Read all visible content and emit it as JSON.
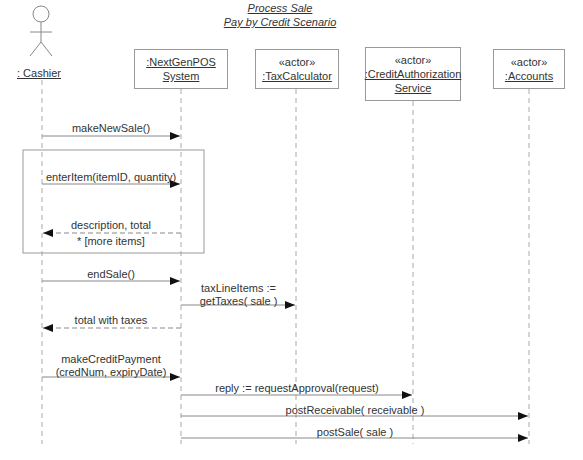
{
  "title": {
    "line1": "Process Sale",
    "line2": "Pay by Credit Scenario"
  },
  "participants": [
    {
      "id": "cashier",
      "kind": "actor-figure",
      "name": ": Cashier"
    },
    {
      "id": "pos",
      "kind": "object",
      "stereotype": "",
      "name_line1": ":NextGenPOS",
      "name_line2": "System"
    },
    {
      "id": "tax",
      "kind": "object",
      "stereotype": "«actor»",
      "name_line1": ":TaxCalculator",
      "name_line2": ""
    },
    {
      "id": "credit",
      "kind": "object",
      "stereotype": "«actor»",
      "name_line1": ":CreditAuthorization",
      "name_line2": "Service"
    },
    {
      "id": "accounts",
      "kind": "object",
      "stereotype": "«actor»",
      "name_line1": ":Accounts",
      "name_line2": ""
    }
  ],
  "loop_fragment": {
    "guard": "* [more items]"
  },
  "messages": [
    {
      "from": "cashier",
      "to": "pos",
      "type": "sync",
      "label": "makeNewSale()"
    },
    {
      "from": "cashier",
      "to": "pos",
      "type": "sync",
      "label": "enterItem(itemID, quantity)"
    },
    {
      "from": "pos",
      "to": "cashier",
      "type": "return",
      "label": "description, total"
    },
    {
      "from": "cashier",
      "to": "pos",
      "type": "sync",
      "label": "endSale()"
    },
    {
      "from": "pos",
      "to": "tax",
      "type": "sync",
      "label_line1": "taxLineItems :=",
      "label_line2": "getTaxes( sale )"
    },
    {
      "from": "pos",
      "to": "cashier",
      "type": "return",
      "label": "total with taxes"
    },
    {
      "from": "cashier",
      "to": "pos",
      "type": "sync",
      "label_line1": "makeCreditPayment",
      "label_line2": "(credNum, expiryDate)"
    },
    {
      "from": "pos",
      "to": "credit",
      "type": "sync",
      "label": "reply := requestApproval(request)"
    },
    {
      "from": "pos",
      "to": "accounts",
      "type": "sync",
      "label": "postReceivable( receivable )"
    },
    {
      "from": "pos",
      "to": "accounts",
      "type": "sync",
      "label": "postSale( sale )"
    }
  ],
  "colors": {
    "line": "#999999",
    "arrowhead": "#111111",
    "text": "#333333"
  }
}
